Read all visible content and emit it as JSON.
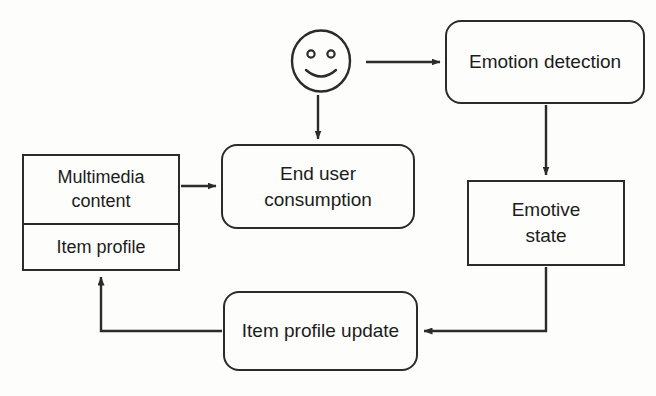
{
  "diagram": {
    "background_color": "#fdfdfb",
    "stroke_color": "#2b2b2b",
    "text_color": "#1c1c1c",
    "nodes": {
      "user_face": {
        "icon": "smiley-face-icon",
        "shape": "circle"
      },
      "emotion_detection": {
        "label": "Emotion detection",
        "shape": "rounded-rectangle"
      },
      "emotive_state": {
        "label": "Emotive\nstate",
        "shape": "rectangle"
      },
      "end_user_consumption": {
        "label": "End user\nconsumption",
        "shape": "rounded-rectangle"
      },
      "item_profile_update": {
        "label": "Item profile update",
        "shape": "rounded-rectangle"
      },
      "content_stack": {
        "shape": "rectangle-two-cell",
        "cells": [
          {
            "label": "Multimedia\ncontent"
          },
          {
            "label": "Item profile"
          }
        ]
      }
    },
    "edges": [
      {
        "from": "user_face",
        "to": "emotion_detection",
        "direction": "right",
        "arrow": true
      },
      {
        "from": "user_face",
        "to": "end_user_consumption",
        "direction": "down",
        "arrow": true
      },
      {
        "from": "emotion_detection",
        "to": "emotive_state",
        "direction": "down",
        "arrow": true
      },
      {
        "from": "emotive_state",
        "to": "item_profile_update",
        "direction": "down-left",
        "arrow": true
      },
      {
        "from": "item_profile_update",
        "to": "content_stack",
        "direction": "left-up",
        "arrow": true
      },
      {
        "from": "content_stack",
        "to": "end_user_consumption",
        "direction": "right",
        "arrow": true
      }
    ]
  }
}
